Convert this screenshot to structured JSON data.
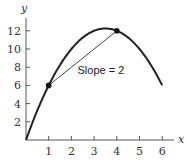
{
  "chart_data": {
    "type": "line",
    "title": "",
    "xlabel": "x",
    "ylabel": "y",
    "xlim": [
      0,
      6.3
    ],
    "ylim": [
      0,
      13.5
    ],
    "x_ticks": [
      1,
      2,
      3,
      4,
      5,
      6
    ],
    "y_ticks": [
      2,
      4,
      6,
      8,
      10,
      12
    ],
    "grid": false,
    "series": [
      {
        "name": "curve",
        "function": "y = 7x - x^2",
        "x": [
          0,
          0.5,
          1,
          1.5,
          2,
          2.5,
          3,
          3.5,
          4,
          4.5,
          5,
          5.5,
          6
        ],
        "y": [
          0,
          3.25,
          6,
          8.25,
          10,
          11.25,
          12,
          12.25,
          12,
          11.25,
          10,
          8.25,
          6
        ]
      },
      {
        "name": "secant",
        "x": [
          1,
          4
        ],
        "y": [
          6,
          12
        ]
      }
    ],
    "points": [
      {
        "x": 1,
        "y": 6
      },
      {
        "x": 4,
        "y": 12
      }
    ],
    "annotations": [
      {
        "text": "Slope = 2",
        "x": 3.3,
        "y": 7.2
      }
    ]
  }
}
